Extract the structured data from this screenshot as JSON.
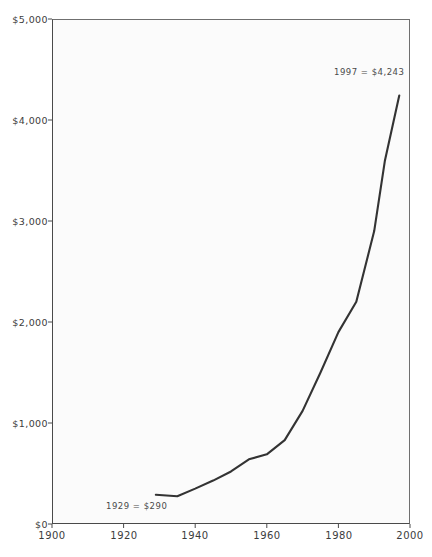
{
  "chart_data": {
    "type": "line",
    "title": "",
    "xlabel": "",
    "ylabel": "",
    "xlim": [
      1900,
      2000
    ],
    "ylim": [
      0,
      5000
    ],
    "grid": false,
    "legend": null,
    "x_ticks": [
      "1900",
      "1920",
      "1940",
      "1960",
      "1980",
      "2000"
    ],
    "x_tick_values": [
      1900,
      1920,
      1940,
      1960,
      1980,
      2000
    ],
    "y_ticks": [
      "$0",
      "$1,000",
      "$2,000",
      "$3,000",
      "$4,000",
      "$5,000"
    ],
    "y_tick_values": [
      0,
      1000,
      2000,
      3000,
      4000,
      5000
    ],
    "series": [
      {
        "name": "value",
        "x": [
          1929,
          1935,
          1940,
          1945,
          1950,
          1955,
          1960,
          1965,
          1970,
          1975,
          1980,
          1985,
          1990,
          1993,
          1997
        ],
        "values": [
          290,
          275,
          350,
          430,
          520,
          640,
          690,
          830,
          1120,
          1500,
          1900,
          2200,
          2900,
          3600,
          4243
        ]
      }
    ],
    "annotations": [
      {
        "name": "start-annotation",
        "text": "1929  =  $290",
        "x": 1929,
        "y": 290
      },
      {
        "name": "end-annotation",
        "text": "1997  =  $4,243",
        "x": 1997,
        "y": 4243
      }
    ],
    "line_color": "#333333",
    "plot_background": "#fbfbfb",
    "axis_color": "#4a4a4a"
  }
}
